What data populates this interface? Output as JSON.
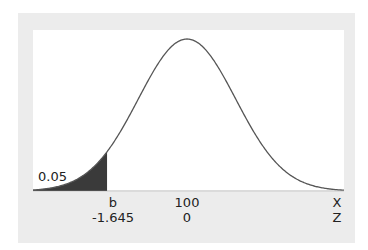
{
  "chart_data": {
    "type": "area",
    "title": "",
    "distribution": "normal",
    "mean_x": 100,
    "shaded_region": {
      "side": "left",
      "area": 0.05,
      "boundary_x_label": "b",
      "boundary_z": -1.645
    },
    "x_axis": {
      "label": "X",
      "ticks": [
        "b",
        "100"
      ]
    },
    "z_axis": {
      "label": "Z",
      "ticks": [
        "-1.645",
        "0"
      ]
    },
    "annotations": [
      "0.05"
    ],
    "grid": false,
    "colors": {
      "curve": "#555555",
      "shade": "#3a3a3a",
      "panel": "#ececec",
      "plot_bg": "#ffffff"
    }
  },
  "labels": {
    "area": "0.05",
    "x_b": "b",
    "x_mean": "100",
    "x_axis": "X",
    "z_b": "-1.645",
    "z_mean": "0",
    "z_axis": "Z"
  }
}
